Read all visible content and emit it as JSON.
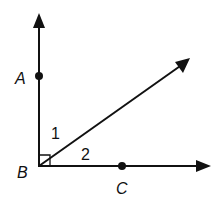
{
  "diagram": {
    "type": "geometry-angles",
    "points": {
      "A": {
        "label": "A"
      },
      "B": {
        "label": "B"
      },
      "C": {
        "label": "C"
      }
    },
    "angles": [
      {
        "label": "1"
      },
      {
        "label": "2"
      }
    ],
    "right_angle_at": "B",
    "colors": {
      "stroke": "#111111",
      "background": "#ffffff"
    }
  }
}
